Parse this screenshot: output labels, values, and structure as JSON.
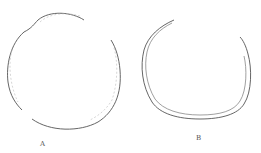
{
  "figure": {
    "panels": [
      {
        "id": "A",
        "label": "A",
        "shape": "near-circular outline with a small notch at the upper left and gaps at the right and lower left"
      },
      {
        "id": "B",
        "label": "B",
        "shape": "open U-shaped double outline with a gap at the top"
      }
    ],
    "colors": {
      "stroke": "#555555",
      "stroke_light": "#aaaaaa",
      "background": "#ffffff"
    }
  }
}
